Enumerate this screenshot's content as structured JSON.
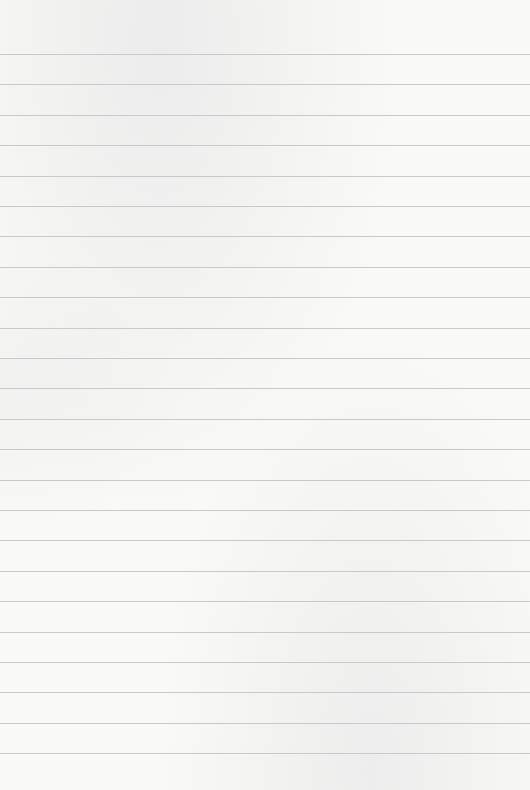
{
  "paper": {
    "type": "ruled-sheet",
    "background_color": "#f9f9f8",
    "line_color": "#c9c9c9",
    "first_line_y": 54,
    "line_spacing": 30.4,
    "line_count": 24
  }
}
